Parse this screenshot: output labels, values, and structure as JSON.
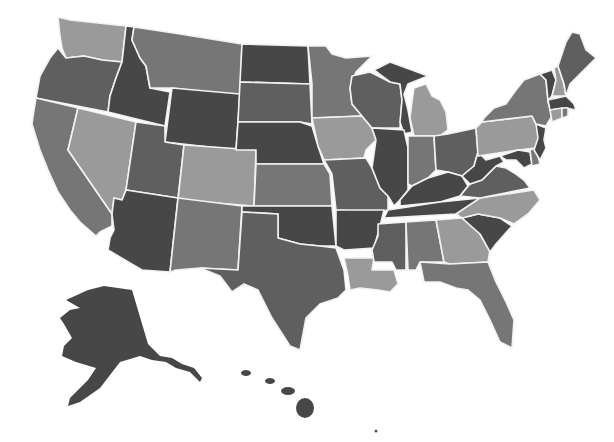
{
  "map": {
    "type": "choropleth",
    "region": "United States",
    "legend": null,
    "shades": {
      "dark": "#474747",
      "medium_dark": "#5f5f5f",
      "medium": "#767676",
      "light": "#9a9a9a"
    },
    "states": [
      {
        "id": "WA",
        "name": "Washington",
        "shade": "light"
      },
      {
        "id": "OR",
        "name": "Oregon",
        "shade": "medium_dark"
      },
      {
        "id": "CA",
        "name": "California",
        "shade": "medium"
      },
      {
        "id": "ID",
        "name": "Idaho",
        "shade": "dark"
      },
      {
        "id": "NV",
        "name": "Nevada",
        "shade": "light"
      },
      {
        "id": "MT",
        "name": "Montana",
        "shade": "medium"
      },
      {
        "id": "WY",
        "name": "Wyoming",
        "shade": "dark"
      },
      {
        "id": "UT",
        "name": "Utah",
        "shade": "medium_dark"
      },
      {
        "id": "AZ",
        "name": "Arizona",
        "shade": "dark"
      },
      {
        "id": "CO",
        "name": "Colorado",
        "shade": "light"
      },
      {
        "id": "NM",
        "name": "New Mexico",
        "shade": "medium"
      },
      {
        "id": "ND",
        "name": "North Dakota",
        "shade": "dark"
      },
      {
        "id": "SD",
        "name": "South Dakota",
        "shade": "medium_dark"
      },
      {
        "id": "NE",
        "name": "Nebraska",
        "shade": "dark"
      },
      {
        "id": "KS",
        "name": "Kansas",
        "shade": "medium"
      },
      {
        "id": "OK",
        "name": "Oklahoma",
        "shade": "dark"
      },
      {
        "id": "TX",
        "name": "Texas",
        "shade": "medium_dark"
      },
      {
        "id": "MN",
        "name": "Minnesota",
        "shade": "medium"
      },
      {
        "id": "IA",
        "name": "Iowa",
        "shade": "light"
      },
      {
        "id": "MO",
        "name": "Missouri",
        "shade": "medium_dark"
      },
      {
        "id": "AR",
        "name": "Arkansas",
        "shade": "dark"
      },
      {
        "id": "LA",
        "name": "Louisiana",
        "shade": "light"
      },
      {
        "id": "WI",
        "name": "Wisconsin",
        "shade": "medium_dark"
      },
      {
        "id": "IL",
        "name": "Illinois",
        "shade": "dark"
      },
      {
        "id": "MI",
        "name": "Michigan",
        "shade": "light"
      },
      {
        "id": "MI_UP",
        "name": "Michigan (Upper/West)",
        "shade": "dark"
      },
      {
        "id": "IN",
        "name": "Indiana",
        "shade": "medium"
      },
      {
        "id": "OH",
        "name": "Ohio",
        "shade": "medium_dark"
      },
      {
        "id": "KY",
        "name": "Kentucky",
        "shade": "dark"
      },
      {
        "id": "TN",
        "name": "Tennessee",
        "shade": "dark"
      },
      {
        "id": "MS",
        "name": "Mississippi",
        "shade": "medium_dark"
      },
      {
        "id": "AL",
        "name": "Alabama",
        "shade": "medium"
      },
      {
        "id": "GA",
        "name": "Georgia",
        "shade": "light"
      },
      {
        "id": "FL",
        "name": "Florida",
        "shade": "medium"
      },
      {
        "id": "SC",
        "name": "South Carolina",
        "shade": "dark"
      },
      {
        "id": "NC",
        "name": "North Carolina",
        "shade": "light"
      },
      {
        "id": "VA",
        "name": "Virginia",
        "shade": "medium_dark"
      },
      {
        "id": "WV",
        "name": "West Virginia",
        "shade": "dark"
      },
      {
        "id": "MD",
        "name": "Maryland",
        "shade": "dark"
      },
      {
        "id": "DE",
        "name": "Delaware",
        "shade": "medium"
      },
      {
        "id": "PA",
        "name": "Pennsylvania",
        "shade": "light"
      },
      {
        "id": "NJ",
        "name": "New Jersey",
        "shade": "dark"
      },
      {
        "id": "NY",
        "name": "New York",
        "shade": "medium"
      },
      {
        "id": "CT",
        "name": "Connecticut",
        "shade": "light"
      },
      {
        "id": "RI",
        "name": "Rhode Island",
        "shade": "medium"
      },
      {
        "id": "MA",
        "name": "Massachusetts",
        "shade": "dark"
      },
      {
        "id": "VT",
        "name": "Vermont",
        "shade": "dark"
      },
      {
        "id": "NH",
        "name": "New Hampshire",
        "shade": "light"
      },
      {
        "id": "ME",
        "name": "Maine",
        "shade": "medium_dark"
      },
      {
        "id": "AK",
        "name": "Alaska",
        "shade": "dark"
      },
      {
        "id": "HI",
        "name": "Hawaii",
        "shade": "dark"
      }
    ]
  }
}
